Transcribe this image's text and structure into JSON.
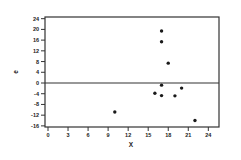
{
  "chart_data": {
    "type": "scatter",
    "title": "",
    "xlabel": "X",
    "ylabel": "e",
    "xlim": [
      -0.5,
      25.5
    ],
    "ylim": [
      -16.5,
      24.5
    ],
    "x_ticks": [
      0,
      3,
      6,
      9,
      12,
      15,
      18,
      21,
      24
    ],
    "y_ticks": [
      24,
      20,
      16,
      12,
      8,
      4,
      0,
      -4,
      -8,
      -12,
      -16
    ],
    "reference_line": {
      "orientation": "horizontal",
      "value": 0
    },
    "grid": false,
    "legend": null,
    "series": [
      {
        "name": "residuals",
        "marker": "filled-circle",
        "color": "#1a1a1a",
        "points": [
          {
            "x": 10,
            "y": -10.8
          },
          {
            "x": 16,
            "y": -3.8
          },
          {
            "x": 17,
            "y": 19.4
          },
          {
            "x": 17,
            "y": 15.4
          },
          {
            "x": 17,
            "y": -0.8
          },
          {
            "x": 17,
            "y": -4.7
          },
          {
            "x": 18,
            "y": 7.4
          },
          {
            "x": 19,
            "y": -4.8
          },
          {
            "x": 20,
            "y": -1.9
          },
          {
            "x": 22,
            "y": -14.0
          }
        ]
      }
    ]
  },
  "colors": {
    "axis": "#333333",
    "marker": "#1a1a1a",
    "background": "#ffffff"
  }
}
